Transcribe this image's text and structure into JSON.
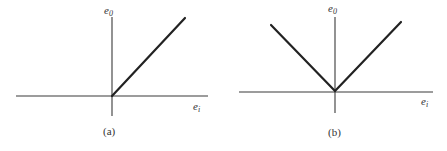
{
  "panels": [
    {
      "id": "a",
      "caption": "(a)",
      "y_label": "e",
      "y_label_sub": "0",
      "x_label": "e",
      "x_label_sub": "i",
      "description": "Half-wave characteristic: output zero for negative input, linear for positive input"
    },
    {
      "id": "b",
      "caption": "(b)",
      "y_label": "e",
      "y_label_sub": "0",
      "x_label": "e",
      "x_label_sub": "i",
      "description": "Full-wave (absolute value) characteristic: V-shaped output"
    }
  ],
  "colors": {
    "axis": "#3a3a3a",
    "curve": "#222222",
    "text": "#333333",
    "background": "#ffffff"
  }
}
